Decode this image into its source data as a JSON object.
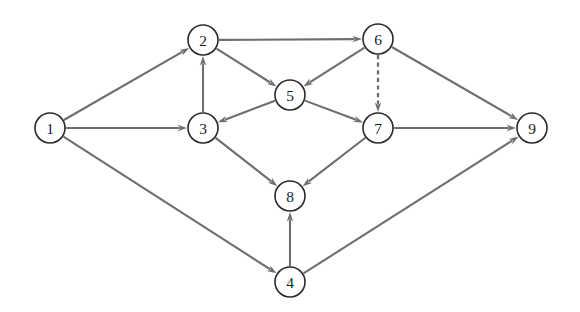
{
  "diagram": {
    "type": "directed-graph",
    "background_color": "#ffffff",
    "node_fill_color": "#ffffff",
    "node_stroke_color": "#2a2a2a",
    "edge_color": "#6e6e6e",
    "label_color": "#1a1a1a",
    "node_radius": 15,
    "node_count": 9,
    "edge_count": 16,
    "nodes": [
      {
        "id": "1",
        "label": "1",
        "x": 50,
        "y": 128
      },
      {
        "id": "2",
        "label": "2",
        "x": 203,
        "y": 40
      },
      {
        "id": "3",
        "label": "3",
        "x": 203,
        "y": 128
      },
      {
        "id": "4",
        "label": "4",
        "x": 290,
        "y": 282
      },
      {
        "id": "5",
        "label": "5",
        "x": 290,
        "y": 95
      },
      {
        "id": "6",
        "label": "6",
        "x": 378,
        "y": 39
      },
      {
        "id": "7",
        "label": "7",
        "x": 378,
        "y": 128
      },
      {
        "id": "8",
        "label": "8",
        "x": 290,
        "y": 196
      },
      {
        "id": "9",
        "label": "9",
        "x": 532,
        "y": 128
      }
    ],
    "edges": [
      {
        "from": "1",
        "to": "2",
        "style": "solid",
        "directed": true
      },
      {
        "from": "1",
        "to": "3",
        "style": "solid",
        "directed": true
      },
      {
        "from": "1",
        "to": "4",
        "style": "solid",
        "directed": true
      },
      {
        "from": "3",
        "to": "2",
        "style": "solid",
        "directed": true
      },
      {
        "from": "2",
        "to": "5",
        "style": "solid",
        "directed": true
      },
      {
        "from": "2",
        "to": "6",
        "style": "solid",
        "directed": true
      },
      {
        "from": "5",
        "to": "3",
        "style": "solid",
        "directed": true
      },
      {
        "from": "6",
        "to": "5",
        "style": "solid",
        "directed": true
      },
      {
        "from": "6",
        "to": "7",
        "style": "dashed",
        "directed": true
      },
      {
        "from": "6",
        "to": "9",
        "style": "solid",
        "directed": true
      },
      {
        "from": "5",
        "to": "7",
        "style": "solid",
        "directed": true
      },
      {
        "from": "3",
        "to": "8",
        "style": "solid",
        "directed": true
      },
      {
        "from": "7",
        "to": "8",
        "style": "solid",
        "directed": true
      },
      {
        "from": "7",
        "to": "9",
        "style": "solid",
        "directed": true
      },
      {
        "from": "4",
        "to": "8",
        "style": "solid",
        "directed": true
      },
      {
        "from": "4",
        "to": "9",
        "style": "solid",
        "directed": true
      }
    ]
  }
}
